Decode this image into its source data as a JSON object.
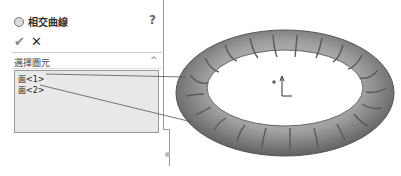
{
  "feature": {
    "icon": "intersection-curve-icon",
    "title": "相交曲線",
    "help_label": "?"
  },
  "actions": {
    "ok_label": "✔",
    "cancel_label": "✕"
  },
  "section": {
    "title": "選擇圖元",
    "collapse_label": "^"
  },
  "selections": [
    {
      "label": "面<1>"
    },
    {
      "label": "面<2>"
    }
  ],
  "colors": {
    "torus": "#8a8a8a",
    "listbox": "#e9e9e9"
  }
}
